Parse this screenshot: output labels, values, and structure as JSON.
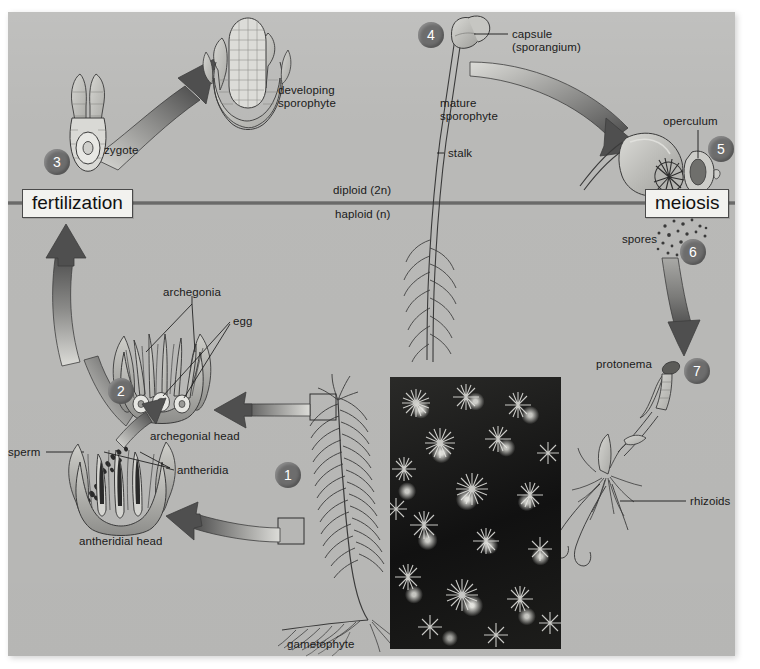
{
  "diagram": {
    "background_color": "#b9b9b7",
    "panel": {
      "x": 8,
      "y": 12,
      "width": 727,
      "height": 644
    },
    "ploidy_divider": {
      "above_label": "diploid (2n)",
      "below_label": "haploid (n)",
      "y": 203
    },
    "events": [
      {
        "id": "fertilization",
        "label": "fertilization",
        "x": 22,
        "y": 190
      },
      {
        "id": "meiosis",
        "label": "meiosis",
        "x": 645,
        "y": 190
      }
    ],
    "steps": [
      {
        "number": "1",
        "x": 275,
        "y": 462
      },
      {
        "number": "2",
        "x": 108,
        "y": 378
      },
      {
        "number": "3",
        "x": 44,
        "y": 149
      },
      {
        "number": "4",
        "x": 418,
        "y": 22
      },
      {
        "number": "5",
        "x": 708,
        "y": 136
      },
      {
        "number": "6",
        "x": 680,
        "y": 239
      },
      {
        "number": "7",
        "x": 684,
        "y": 358
      }
    ],
    "labels": [
      {
        "id": "developing-sporophyte",
        "text": "developing\nsporophyte",
        "x": 278,
        "y": 84,
        "align": "left"
      },
      {
        "id": "zygote",
        "text": "zygote",
        "x": 104,
        "y": 144,
        "align": "left"
      },
      {
        "id": "capsule-sporangium",
        "text": "capsule\n(sporangium)",
        "x": 512,
        "y": 29,
        "align": "left"
      },
      {
        "id": "mature-sporophyte",
        "text": "mature\nsporophyte",
        "x": 440,
        "y": 98,
        "align": "left"
      },
      {
        "id": "stalk",
        "text": "stalk",
        "x": 448,
        "y": 148,
        "align": "left"
      },
      {
        "id": "operculum",
        "text": "operculum",
        "x": 664,
        "y": 116,
        "align": "left"
      },
      {
        "id": "spores",
        "text": "spores",
        "x": 623,
        "y": 234,
        "align": "left"
      },
      {
        "id": "protonema",
        "text": "protonema",
        "x": 596,
        "y": 359,
        "align": "left"
      },
      {
        "id": "rhizoids",
        "text": "rhizoids",
        "x": 690,
        "y": 497,
        "align": "left"
      },
      {
        "id": "archegonia",
        "text": "archegonia",
        "x": 163,
        "y": 296,
        "align": "left"
      },
      {
        "id": "egg",
        "text": "egg",
        "x": 233,
        "y": 317,
        "align": "left"
      },
      {
        "id": "archegonial-head",
        "text": "archegonial head",
        "x": 150,
        "y": 432,
        "align": "left"
      },
      {
        "id": "sperm",
        "text": "sperm",
        "x": 10,
        "y": 448,
        "align": "left"
      },
      {
        "id": "antheridia",
        "text": "antheridia",
        "x": 176,
        "y": 466,
        "align": "left"
      },
      {
        "id": "antheridial-head",
        "text": "antheridial head",
        "x": 79,
        "y": 537,
        "align": "left"
      },
      {
        "id": "gametophyte",
        "text": "gametophyte",
        "x": 287,
        "y": 640,
        "align": "left"
      }
    ],
    "colors": {
      "panel": "#b9b9b7",
      "arrow_dark": "#4f4f4f",
      "arrow_light": "#cfcfcb",
      "divider": "#555555",
      "step_circle": "#6d6d6d",
      "text": "#1a1a1a",
      "box_fill": "#f2f2ef",
      "box_border": "#4a4a4a",
      "photo_dark": "#141414"
    },
    "photo": {
      "id": "moss-colony-photograph",
      "x": 390,
      "y": 377,
      "width": 171,
      "height": 272,
      "caption": ""
    },
    "structures": [
      {
        "id": "zygote-archegonium",
        "label": "zygote"
      },
      {
        "id": "developing-sporophyte-drawing",
        "label": "developing sporophyte"
      },
      {
        "id": "mature-sporophyte-drawing",
        "label": "mature sporophyte"
      },
      {
        "id": "capsule-open-drawing",
        "label": "capsule with operculum"
      },
      {
        "id": "spore-cloud",
        "label": "spores"
      },
      {
        "id": "protonema-drawing",
        "label": "protonema with rhizoids"
      },
      {
        "id": "gametophyte-drawing",
        "label": "gametophyte"
      },
      {
        "id": "archegonial-head-drawing",
        "label": "archegonial head"
      },
      {
        "id": "antheridial-head-drawing",
        "label": "antheridial head"
      }
    ]
  }
}
